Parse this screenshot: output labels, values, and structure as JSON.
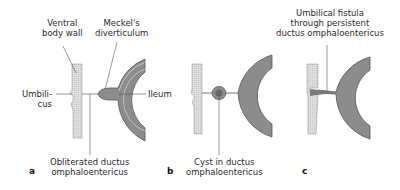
{
  "figure": {
    "panels": [
      {
        "letter": "a",
        "labels": {
          "ventral_body_wall": [
            "Ventral",
            "body wall"
          ],
          "meckels_diverticulum": [
            "Meckel's",
            "diverticulum"
          ],
          "umbilicus": [
            "Umbili-",
            "cus"
          ],
          "ileum": "Ileum",
          "bottom": [
            "Obliterated ductus",
            "omphaloentericus"
          ]
        }
      },
      {
        "letter": "b",
        "labels": {
          "bottom": [
            "Cyst in ductus",
            "omphaloentericus"
          ]
        }
      },
      {
        "letter": "c",
        "labels": {
          "top": [
            "Umbilical fistula",
            "through persistent",
            "ductus omphaloentericus"
          ]
        }
      }
    ],
    "colors": {
      "body_wall_fill": "#d9d9d9",
      "intestine_fill": "#8c8c8c",
      "intestine_outline": "#555555",
      "leader_line": "#555555"
    }
  }
}
